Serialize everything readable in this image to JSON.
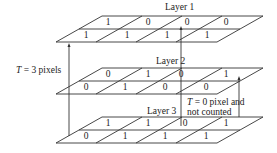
{
  "layers": [
    {
      "label": "Layer 1",
      "back_row": [
        "1",
        "0",
        "0",
        "0"
      ],
      "front_row": [
        "1",
        "1",
        "1",
        "1"
      ]
    },
    {
      "label": "Layer 2",
      "back_row": [
        "0",
        "1",
        "0",
        "1"
      ],
      "front_row": [
        "0",
        "1",
        "0",
        "0"
      ]
    },
    {
      "label": "Layer 3",
      "back_row": [
        "1",
        "1",
        "0",
        "1"
      ],
      "front_row": [
        "0",
        "1",
        "1",
        "1"
      ]
    }
  ],
  "annotations": {
    "left_t": "T",
    "left_rest": " = 3 pixels",
    "right_t": "T",
    "right_line1_rest": " = 0 pixel and",
    "right_line2": "not counted"
  },
  "colors": {
    "line": "#333333",
    "text": "#222222"
  }
}
